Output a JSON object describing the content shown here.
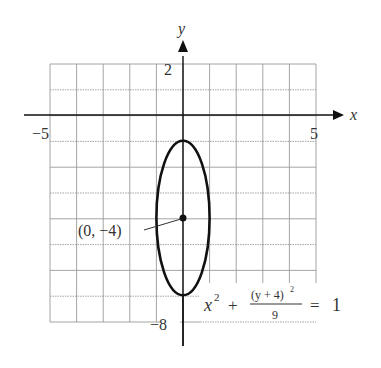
{
  "figure": {
    "type": "ellipse-graph",
    "axes": {
      "x_label": "x",
      "y_label": "y",
      "x_ticks": [
        {
          "value": -5,
          "label": "−5"
        },
        {
          "value": 5,
          "label": "5"
        }
      ],
      "y_ticks": [
        {
          "value": 2,
          "label": "2"
        },
        {
          "value": -8,
          "label": "−8"
        }
      ],
      "x_range": [
        -5,
        5
      ],
      "y_range": [
        -8,
        2
      ]
    },
    "grid": {
      "x_step": 1,
      "y_step": 1,
      "color": "#9a9a9a"
    },
    "ellipse": {
      "center": [
        0,
        -4
      ],
      "semi_x": 1,
      "semi_y": 3,
      "color": "#111111"
    },
    "center_label": "(0, −4)",
    "equation": {
      "lhs_var": "x",
      "lhs_exp": "2",
      "plus": "+",
      "numerator": "(y + 4)",
      "numerator_exp": "2",
      "denominator": "9",
      "equals": "=",
      "rhs": "1"
    }
  }
}
